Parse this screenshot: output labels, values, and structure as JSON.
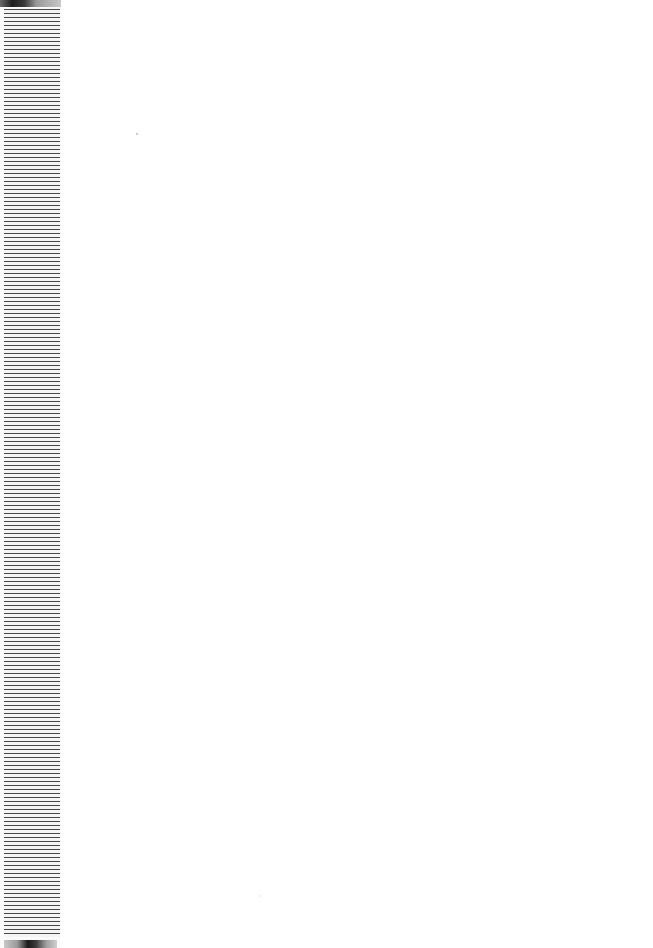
{
  "page": {
    "background": "#ffffff",
    "content": ""
  },
  "left_strip": {
    "pattern": "horizontal-stripes",
    "stripe_color": "#4a4a4a",
    "gap_color": "#f4f4f4"
  },
  "specks": [
    {
      "x": 136,
      "y": 133
    },
    {
      "x": 259,
      "y": 895
    }
  ]
}
